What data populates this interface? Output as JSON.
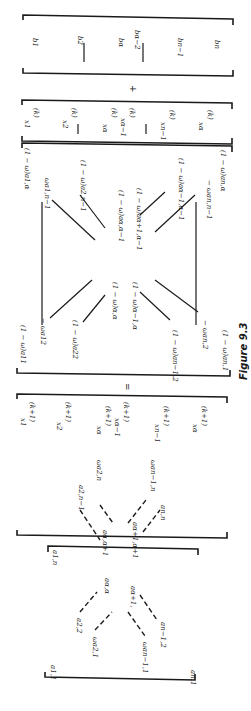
{
  "figure": {
    "caption": "Figure 9.3",
    "equals": "=",
    "plus": "+",
    "b_vector": {
      "entries": [
        "b1",
        "b2",
        "bα",
        "bα−2",
        "bn−1",
        "bn"
      ]
    },
    "x_k_vector": {
      "superscript": "(k)",
      "entries": [
        "x1",
        "x2",
        "xα",
        "xα−1",
        "xn−1",
        "xα"
      ]
    },
    "x_k1_vector": {
      "superscript": "(k+1)",
      "entries": [
        "x1",
        "x2",
        "xα",
        "xα−1",
        "xn−1",
        "xα"
      ]
    },
    "right_matrix": {
      "entries": [
        "(1 − ω)a1,α",
        "ωa1,n−1",
        "(1 − ω)a2,n−1",
        "(1 − ω)aα,α−1",
        "(1 − ω)aα+1,α−1",
        "(1 − ω)aα−1,α−1",
        "− ωan,n−1",
        "(1 − ω)an,α",
        "(1 − ω)a11",
        "− ωa12",
        "(1 − ω)a22",
        "(1 − ω)α,α",
        "(1 − ω)α−1,α",
        "(1 − ω)an−1,2",
        "− ωan,2",
        "(1 − ω)an,1"
      ]
    },
    "left_matrix": {
      "entries": [
        "a1,n",
        "ωa2,n",
        "ωan−1,n",
        "a2,n−1",
        "aα,α+1",
        "aα+1,α+1",
        "an,n",
        "aα,α",
        "aα+1,",
        "a2,2",
        "ωa2,1",
        "an−1,2",
        "ωan−1,1",
        "a1,1",
        "an,1"
      ]
    }
  }
}
